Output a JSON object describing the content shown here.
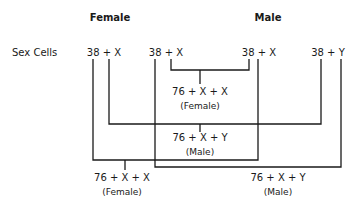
{
  "headers": {
    "female": "Female",
    "male": "Male"
  },
  "row_label": "Sex Cells",
  "sex_cells": [
    {
      "id": "female-egg-1",
      "label": "38 + X"
    },
    {
      "id": "female-egg-2",
      "label": "38 + X"
    },
    {
      "id": "male-sperm-x",
      "label": "38 + X"
    },
    {
      "id": "male-sperm-y",
      "label": "38 + Y"
    }
  ],
  "offspring": [
    {
      "formula": "76 + X + X",
      "sex": "(Female)"
    },
    {
      "formula": "76 + X + Y",
      "sex": "(Male)"
    },
    {
      "formula": "76 + X + X",
      "sex": "(Female)"
    },
    {
      "formula": "76 + X + Y",
      "sex": "(Male)"
    }
  ]
}
